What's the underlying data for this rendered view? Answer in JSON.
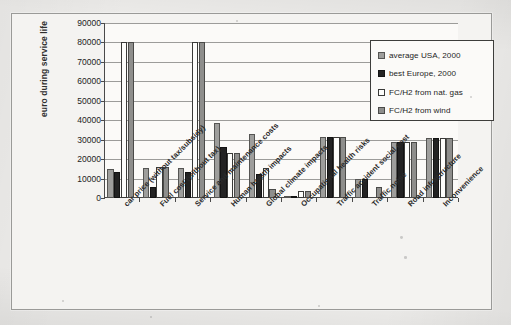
{
  "chart_data": {
    "type": "bar",
    "title": "",
    "xlabel": "",
    "ylabel": "euro during service life",
    "ylim": [
      0,
      90000
    ],
    "ytick_step": 10000,
    "yticks": [
      "90000",
      "80000",
      "70000",
      "60000",
      "50000",
      "40000",
      "30000",
      "20000",
      "10000",
      "0"
    ],
    "grid": true,
    "legend_position": "top-right",
    "clip_note": "Bars for 'car price (without tax/subsidy)' FC/H2 series and 'Human health impacts' are drawn clipped at the 80000 gridline in the original scan.",
    "categories": [
      "car price (without tax/subsidy)",
      "Fuel cost (without tax)",
      "Service and maintenance costs",
      "Human health impacts",
      "Global climate impacts",
      "Occupational health risks",
      "Traffic accident social cost",
      "Traffic noise",
      "Road infrastructure",
      "Inconvenience"
    ],
    "series": [
      {
        "name": "average USA, 2000",
        "color": "#9e9e9c",
        "values": [
          15000,
          15200,
          15200,
          38500,
          32700,
          700,
          31600,
          9800,
          28800,
          30800
        ]
      },
      {
        "name": "best Europe, 2000",
        "color": "#232323",
        "values": [
          13200,
          5600,
          13200,
          26200,
          12600,
          500,
          31600,
          9800,
          28800,
          30800
        ]
      },
      {
        "name": "FC/H2 from nat. gas",
        "color": "#fdfdfb",
        "values": [
          80000,
          16000,
          80000,
          23000,
          15300,
          3800,
          31600,
          0,
          28800,
          30800
        ]
      },
      {
        "name": "FC/H2 from wind",
        "color": "#8e8e8c",
        "values": [
          80000,
          16000,
          80000,
          23000,
          4800,
          3800,
          31600,
          5600,
          28800,
          30800
        ]
      }
    ]
  },
  "legend": {
    "items": [
      {
        "label": "average USA, 2000",
        "swatch": "legend-swatch-average-usa"
      },
      {
        "label": "best Europe, 2000",
        "swatch": "legend-swatch-best-europe"
      },
      {
        "label": "FC/H2 from nat. gas",
        "swatch": "legend-swatch-fch2-nat-gas"
      },
      {
        "label": "FC/H2 from wind",
        "swatch": "legend-swatch-fch2-wind"
      }
    ]
  }
}
